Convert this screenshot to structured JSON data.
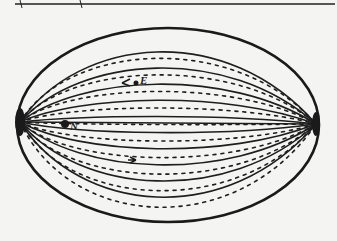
{
  "diagram": {
    "type": "field-lines-ellipse",
    "labels": [
      {
        "text": "E",
        "x": 140,
        "y": 74
      },
      {
        "text": "N",
        "x": 70,
        "y": 120
      }
    ],
    "colors": {
      "ink": "#1e1e1e",
      "paper": "#f4f4f2"
    },
    "header_fragment": "(partially cropped handwritten header line)"
  }
}
